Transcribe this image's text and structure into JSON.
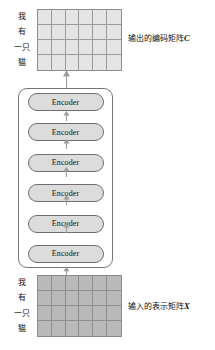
{
  "diagram": {
    "colors": {
      "output_matrix_fill": "#e4e4e4",
      "input_matrix_fill": "#b9b9b9",
      "encoder_fill": "#dcdcdc",
      "border": "#767676",
      "arrow": "#9d9d9d"
    }
  },
  "output_matrix": {
    "label": "输出的编码矩阵",
    "variable": "C",
    "rows": 4,
    "cols": 6,
    "tokens": [
      "我",
      "有",
      "一只",
      "猫"
    ]
  },
  "input_matrix": {
    "label": "输入的表示矩阵",
    "variable": "X",
    "rows": 4,
    "cols": 6,
    "tokens": [
      "我",
      "有",
      "一只",
      "猫"
    ]
  },
  "encoder_stack": {
    "count": 6,
    "blocks": [
      {
        "label": "Encoder"
      },
      {
        "label": "Encoder"
      },
      {
        "label": "Encoder"
      },
      {
        "label": "Encoder"
      },
      {
        "label": "Encoder"
      },
      {
        "label": "Encoder"
      }
    ]
  },
  "arrows": {
    "input_to_stack": "arrow-up-icon",
    "stack_to_output": "arrow-up-icon",
    "between_blocks": "arrow-up-icon"
  }
}
